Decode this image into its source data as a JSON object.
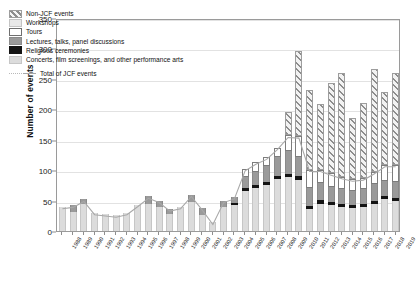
{
  "chart_data": {
    "type": "bar",
    "title": "",
    "xlabel": "",
    "ylabel": "Number of events",
    "ylim": [
      0,
      350
    ],
    "yticks": [
      0,
      50,
      100,
      150,
      200,
      250,
      300,
      350
    ],
    "grid": true,
    "stacked": true,
    "legend_position": "top-left",
    "categories": [
      "1988",
      "1989",
      "1990",
      "1991",
      "1992",
      "1993",
      "1994",
      "1995",
      "1996",
      "1997",
      "1998",
      "1999",
      "2000",
      "2001",
      "2002",
      "2003",
      "2004",
      "2005",
      "2006",
      "2007",
      "2008",
      "2009",
      "2010",
      "2011",
      "2012",
      "2013",
      "2014",
      "2015",
      "2016",
      "2017",
      "2018",
      "2019"
    ],
    "series": [
      {
        "name": "Concerts, film screenings, and other performance arts",
        "color": "#dcdcdc",
        "values": [
          40,
          32,
          44,
          30,
          28,
          26,
          30,
          43,
          45,
          40,
          28,
          40,
          48,
          26,
          14,
          40,
          42,
          65,
          70,
          76,
          86,
          88,
          84,
          36,
          45,
          42,
          40,
          38,
          40,
          44,
          52,
          50
        ]
      },
      {
        "name": "Religious ceremonies",
        "color": "#141414",
        "values": [
          0,
          0,
          0,
          0,
          0,
          0,
          0,
          0,
          0,
          0,
          0,
          0,
          0,
          0,
          0,
          0,
          4,
          5,
          5,
          5,
          5,
          5,
          6,
          5,
          6,
          5,
          5,
          5,
          5,
          5,
          5,
          5
        ]
      },
      {
        "name": "Lectures, talks, panel discussions",
        "color": "#9a9a9a",
        "values": [
          0,
          10,
          8,
          0,
          0,
          0,
          0,
          0,
          12,
          10,
          8,
          0,
          12,
          12,
          0,
          10,
          10,
          18,
          22,
          26,
          30,
          38,
          32,
          30,
          28,
          26,
          24,
          22,
          24,
          28,
          26,
          26
        ]
      },
      {
        "name": "Tours",
        "color": "#ffffff",
        "values": [
          0,
          0,
          0,
          0,
          0,
          0,
          0,
          0,
          0,
          0,
          0,
          0,
          0,
          0,
          0,
          0,
          0,
          14,
          16,
          14,
          16,
          26,
          34,
          30,
          22,
          22,
          20,
          20,
          18,
          20,
          26,
          28
        ]
      },
      {
        "name": "Workshops",
        "color": "#e8e8e8",
        "values": [
          0,
          0,
          0,
          0,
          0,
          0,
          0,
          0,
          0,
          0,
          0,
          0,
          0,
          0,
          0,
          0,
          0,
          0,
          0,
          0,
          0,
          0,
          0,
          0,
          0,
          0,
          0,
          0,
          0,
          0,
          0,
          0
        ]
      },
      {
        "name": "Non-JCF events",
        "color": "#8d8d8d",
        "values": [
          0,
          0,
          0,
          0,
          0,
          0,
          0,
          0,
          0,
          0,
          0,
          0,
          0,
          0,
          0,
          0,
          0,
          0,
          0,
          0,
          0,
          38,
          140,
          130,
          108,
          148,
          170,
          100,
          124,
          170,
          120,
          150
        ]
      }
    ],
    "line_series": {
      "name": "Total of JCF events",
      "color": "#a8a8a8",
      "values": [
        40,
        42,
        52,
        30,
        28,
        26,
        30,
        43,
        57,
        50,
        36,
        40,
        60,
        38,
        14,
        50,
        56,
        102,
        113,
        121,
        137,
        157,
        156,
        101,
        101,
        95,
        89,
        85,
        87,
        97,
        109,
        109
      ]
    }
  },
  "legend": {
    "items": [
      {
        "label": "Non-JCF events",
        "swatch": "nonjcf"
      },
      {
        "label": "Workshops",
        "swatch": "workshops"
      },
      {
        "label": "Tours",
        "swatch": "tours"
      },
      {
        "label": "Lectures, talks, panel discussions",
        "swatch": "lectures"
      },
      {
        "label": "Religious ceremonies",
        "swatch": "religious"
      },
      {
        "label": "Concerts, film screenings, and other performance arts",
        "swatch": "concerts"
      }
    ],
    "line_label": "Total of JCF events"
  }
}
